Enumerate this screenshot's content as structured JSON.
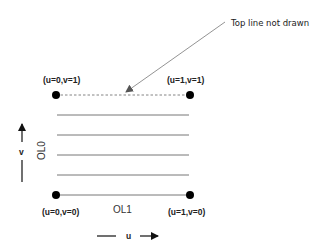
{
  "diagram": {
    "annotation": "Top line not drawn",
    "corners": {
      "top_left": "(u=0,v=1)",
      "top_right": "(u=1,v=1)",
      "bottom_left": "(u=0,v=0)",
      "bottom_right": "(u=1,v=0)"
    },
    "outer_level_labels": {
      "ol0": "OL0",
      "ol1": "OL1"
    },
    "axes": {
      "u": "u",
      "v": "v"
    },
    "colors": {
      "lines": "#666666",
      "dots": "#000000",
      "text": "#222222"
    }
  }
}
